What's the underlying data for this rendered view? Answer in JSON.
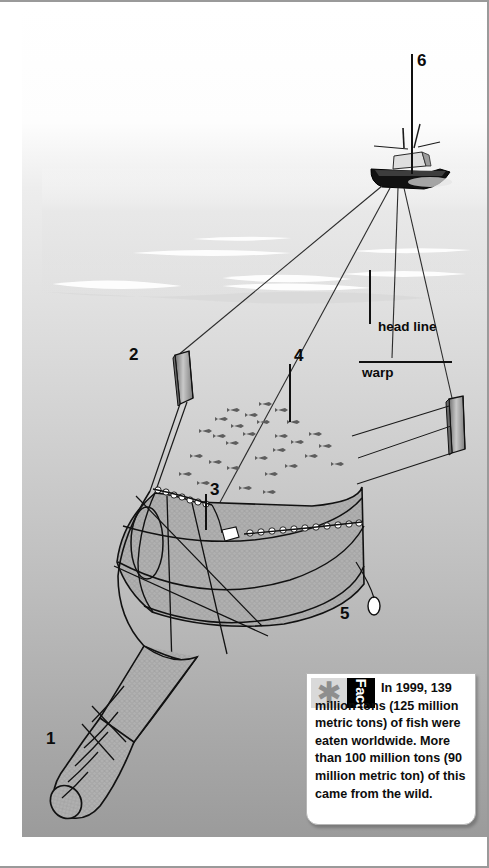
{
  "figure": {
    "type": "labeled-diagram",
    "callouts": [
      {
        "id": "1",
        "number": "1",
        "target": "cod end of trawl net"
      },
      {
        "id": "2",
        "number": "2",
        "target": "otter board (trawl door), left"
      },
      {
        "id": "3",
        "number": "3",
        "target": "head line floats"
      },
      {
        "id": "4",
        "number": "4",
        "target": "school of fish"
      },
      {
        "id": "5",
        "number": "5",
        "target": "float"
      },
      {
        "id": "6",
        "number": "6",
        "target": "trawler boat"
      }
    ],
    "text_labels": [
      {
        "id": "head-line",
        "text": "head line"
      },
      {
        "id": "warp",
        "text": "warp"
      }
    ]
  },
  "fact_box": {
    "star_icon": "asterisk-icon",
    "tag_label": "Fact",
    "body": "In 1999, 139 million tons (125 million metric tons) of fish were eaten worldwide. More than 100 million tons (90 million metric ton) of this came from the wild."
  },
  "colors": {
    "border": "#9a9a9a",
    "ink": "#111111",
    "water_top": "#fdfdfd",
    "water_bottom": "#9d9d9d",
    "net_fill": "#a8a8a8",
    "tag_bg": "#000000",
    "star_bg": "#d9d9d9"
  }
}
